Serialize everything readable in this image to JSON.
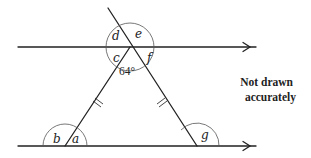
{
  "diagram": {
    "type": "geometry-angles",
    "angle_labels": {
      "a": "a",
      "b": "b",
      "c": "c",
      "d": "d",
      "e": "e",
      "f": "f",
      "g": "g"
    },
    "apex_angle": "64°",
    "note_line1": "Not drawn",
    "note_line2": "accurately",
    "equal_side_marks": "double tick on both slanted sides",
    "parallel_marks": "single arrow on each horizontal line"
  }
}
